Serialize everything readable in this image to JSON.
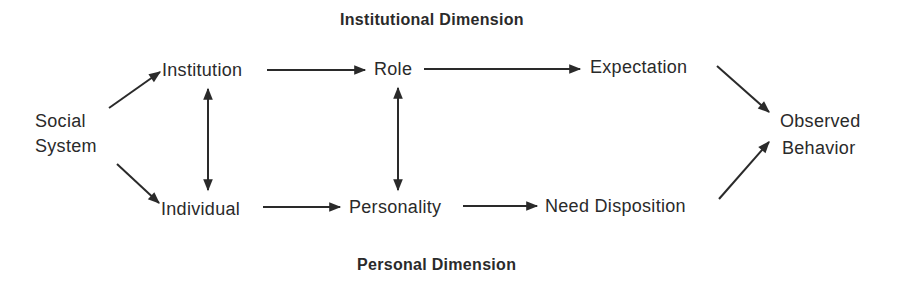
{
  "diagram": {
    "headers": {
      "top": "Institutional Dimension",
      "bottom": "Personal Dimension"
    },
    "nodes": {
      "social_system_line1": "Social",
      "social_system_line2": "System",
      "institution": "Institution",
      "role": "Role",
      "expectation": "Expectation",
      "individual": "Individual",
      "personality": "Personality",
      "need_disposition": "Need Disposition",
      "observed_line1": "Observed",
      "observed_line2": "Behavior"
    },
    "edges": [
      {
        "from": "Social System",
        "to": "Institution"
      },
      {
        "from": "Social System",
        "to": "Individual"
      },
      {
        "from": "Institution",
        "to": "Role"
      },
      {
        "from": "Role",
        "to": "Expectation"
      },
      {
        "from": "Expectation",
        "to": "Observed Behavior"
      },
      {
        "from": "Individual",
        "to": "Personality"
      },
      {
        "from": "Personality",
        "to": "Need Disposition"
      },
      {
        "from": "Need Disposition",
        "to": "Observed Behavior"
      },
      {
        "from": "Institution",
        "to": "Individual",
        "bidirectional": true
      },
      {
        "from": "Role",
        "to": "Personality",
        "bidirectional": true
      }
    ],
    "colors": {
      "ink": "#2a2a2a",
      "background": "#ffffff"
    }
  }
}
